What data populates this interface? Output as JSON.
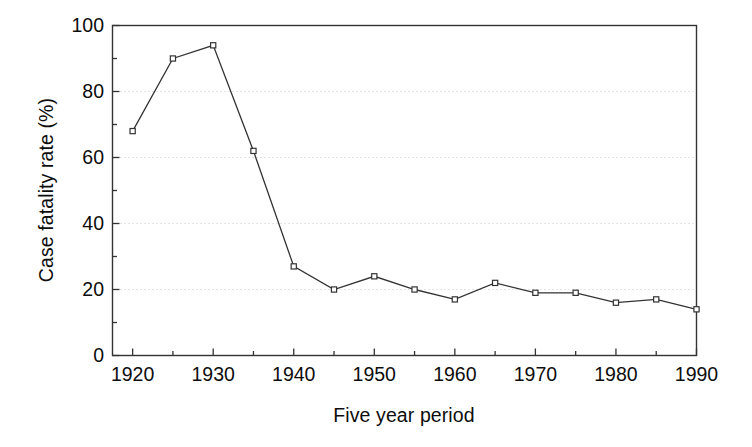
{
  "chart_data": {
    "type": "line",
    "title": "",
    "xlabel": "Five year period",
    "ylabel": "Case fatality rate (%)",
    "x": [
      1920,
      1925,
      1930,
      1935,
      1940,
      1945,
      1950,
      1955,
      1960,
      1965,
      1970,
      1975,
      1980,
      1985,
      1990
    ],
    "values": [
      68,
      90,
      94,
      62,
      27,
      20,
      24,
      20,
      17,
      22,
      19,
      19,
      16,
      17,
      14
    ],
    "series": [
      {
        "name": "Case fatality rate",
        "values": [
          68,
          90,
          94,
          62,
          27,
          20,
          24,
          20,
          17,
          22,
          19,
          19,
          16,
          17,
          14
        ]
      }
    ],
    "xlim": [
      1917.5,
      1990
    ],
    "ylim": [
      0,
      100
    ],
    "x_major_ticks": [
      1920,
      1930,
      1940,
      1950,
      1960,
      1970,
      1980,
      1990
    ],
    "x_major_tick_labels": [
      "1920",
      "1930",
      "1940",
      "1950",
      "1960",
      "1970",
      "1980",
      "1990"
    ],
    "x_minor_ticks": [
      1925,
      1935,
      1945,
      1955,
      1965,
      1975,
      1985
    ],
    "y_major_ticks": [
      0,
      20,
      40,
      60,
      80,
      100
    ],
    "y_major_tick_labels": [
      "0",
      "20",
      "40",
      "60",
      "80",
      "100"
    ],
    "y_minor_ticks": [
      10,
      30,
      50,
      70,
      90
    ],
    "gridlines": {
      "y_values": [
        20,
        40,
        60,
        80
      ],
      "style": "dotted",
      "color": "#c8c8c8",
      "x_grid": false
    },
    "marker": "open-square",
    "line_color": "#333333",
    "marker_edge_color": "#333333",
    "marker_face_color": "#ffffff",
    "legend": null,
    "background_color": "#ffffff",
    "axis_color": "#333333"
  }
}
